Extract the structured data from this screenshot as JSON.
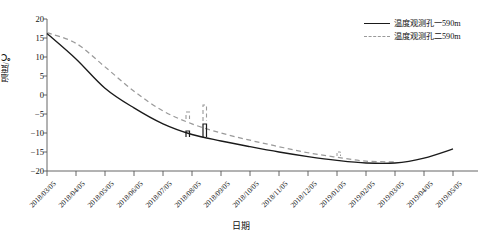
{
  "figure": {
    "background": "#ffffff",
    "top_cropped_caption": ""
  },
  "legend": {
    "position": "top-right",
    "items": [
      {
        "label": "温度观测孔一590m",
        "style": "solid",
        "color": "#1a1a1a",
        "key_icon": "solid-line-icon"
      },
      {
        "label": "温度观测孔二590m",
        "style": "dashed",
        "color": "#9a9a9a",
        "key_icon": "dashed-line-icon"
      }
    ]
  },
  "axes": {
    "y": {
      "label": "温度/℃",
      "ticks": [
        20,
        15,
        10,
        5,
        0,
        -5,
        -10,
        -15,
        -20
      ],
      "tick_labels": [
        "20",
        "15",
        "10",
        "5",
        "0",
        "−5",
        "−10",
        "−15",
        "−20"
      ],
      "limits": [
        -20,
        20
      ]
    },
    "x": {
      "label": "日期",
      "tick_labels": [
        "2018/03/05",
        "2018/04/05",
        "2018/05/05",
        "2018/06/05",
        "2018/07/05",
        "2018/08/05",
        "2018/09/05",
        "2018/10/05",
        "2018/11/05",
        "2018/12/05",
        "2019/01/05",
        "2019/02/05",
        "2019/03/05",
        "2019/04/05",
        "2019/05/05"
      ],
      "rotation_deg": -45
    }
  },
  "chart_data": {
    "type": "line",
    "title": "",
    "xlabel": "日期",
    "ylabel": "温度/℃",
    "ylim": [
      -20,
      20
    ],
    "grid": false,
    "legend_position": "top-right",
    "categories": [
      "2018/03/05",
      "2018/04/05",
      "2018/05/05",
      "2018/06/05",
      "2018/07/05",
      "2018/08/05",
      "2018/09/05",
      "2018/10/05",
      "2018/11/05",
      "2018/12/05",
      "2019/01/05",
      "2019/02/05",
      "2019/03/05",
      "2019/04/05",
      "2019/05/05"
    ],
    "series": [
      {
        "name": "温度观测孔一590m",
        "style": "solid",
        "color": "#1a1a1a",
        "values": [
          16.2,
          9.5,
          1.8,
          -3.4,
          -7.6,
          -10.4,
          -12.1,
          -13.6,
          -15.0,
          -16.2,
          -17.2,
          -17.9,
          -17.9,
          -16.6,
          -14.2
        ]
      },
      {
        "name": "温度观测孔二590m",
        "style": "dashed",
        "color": "#9a9a9a",
        "values": [
          16.4,
          13.6,
          7.4,
          1.0,
          -4.2,
          -7.6,
          -10.0,
          -11.9,
          -13.6,
          -15.2,
          -16.4,
          -17.4,
          -17.6,
          null,
          null
        ]
      }
    ],
    "annotations": [
      {
        "text": "data step artifact",
        "near_category": "2018/08/05",
        "series": "温度观测孔一590m"
      },
      {
        "text": "data step artifact",
        "near_category": "2018/09/05",
        "series": "温度观测孔二590m"
      }
    ]
  }
}
